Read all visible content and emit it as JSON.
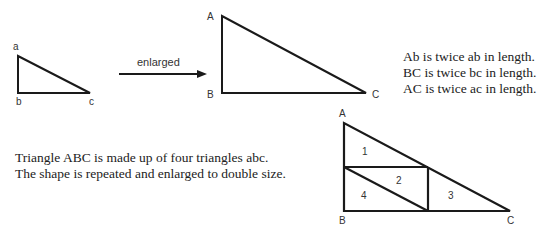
{
  "small_triangle": {
    "labels": {
      "a": "a",
      "b": "b",
      "c": "c"
    }
  },
  "arrow": {
    "label": "enlarged"
  },
  "large_triangle": {
    "labels": {
      "A": "A",
      "B": "B",
      "C": "C"
    }
  },
  "right_text": [
    "Ab is twice ab in length.",
    "BC is twice bc in length.",
    "AC is twice ac in length."
  ],
  "left_text": [
    "Triangle ABC is made up of four triangles abc.",
    "The shape is repeated and enlarged to double size."
  ],
  "composite_triangle": {
    "labels": {
      "A": "A",
      "B": "B",
      "C": "C"
    },
    "regions": [
      "1",
      "2",
      "3",
      "4"
    ]
  },
  "colors": {
    "stroke": "#1a1a1a",
    "text": "#222222",
    "background": "#ffffff"
  }
}
